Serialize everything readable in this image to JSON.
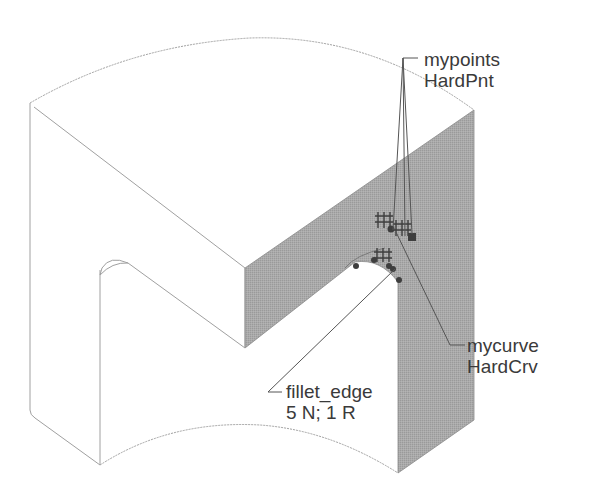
{
  "diagram": {
    "type": "cad-isometric-part",
    "colors": {
      "background": "#ffffff",
      "edge": "#9a9a9a",
      "shaded_face": "#a8a8a8",
      "marker": "#4a4a4a",
      "label_text": "#3a3a3a"
    },
    "labels": [
      {
        "id": "mypoints",
        "line1": "mypoints",
        "line2": "HardPnt"
      },
      {
        "id": "mycurve",
        "line1": "mycurve",
        "line2": "HardCrv"
      },
      {
        "id": "fillet_edge",
        "line1": "fillet_edge",
        "line2": "5 N; 1 R"
      }
    ]
  }
}
